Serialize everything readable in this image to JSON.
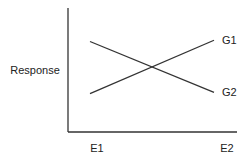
{
  "chart_data": {
    "type": "line",
    "title": "",
    "xlabel": "",
    "ylabel": "Response",
    "categories": [
      "E1",
      "E2"
    ],
    "ylim": [
      0,
      10
    ],
    "grid": false,
    "legend": "inline-right",
    "series": [
      {
        "name": "G1",
        "values": [
          3.1,
          7.4
        ]
      },
      {
        "name": "G2",
        "values": [
          7.3,
          3.2
        ]
      }
    ]
  },
  "colors": {
    "axis": "#333333",
    "line": "#333333",
    "text": "#222222"
  }
}
